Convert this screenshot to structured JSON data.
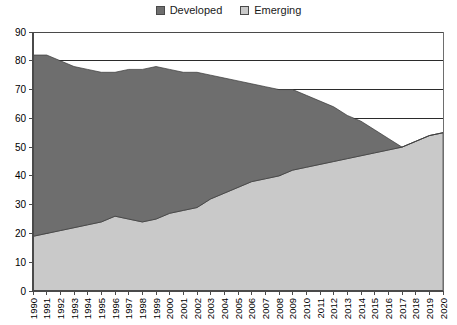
{
  "legend": {
    "position": "top-center",
    "entries": [
      {
        "label": "Developed",
        "color": "#6e6e6e",
        "swatch": "developed-swatch"
      },
      {
        "label": "Emerging",
        "color": "#c9c9c9",
        "swatch": "emerging-swatch"
      }
    ]
  },
  "chart_data": {
    "type": "area",
    "stacked": true,
    "title": "",
    "subtitle": "",
    "xlabel": "",
    "ylabel": "",
    "xlim": [
      1990,
      2020
    ],
    "ylim": [
      0,
      90
    ],
    "ytick_step": 10,
    "grid": true,
    "grid_axis": "y",
    "legend_position": "top-center",
    "categories": [
      "1990",
      "1991",
      "1992",
      "1993",
      "1994",
      "1995",
      "1996",
      "1997",
      "1998",
      "1999",
      "2000",
      "2001",
      "2002",
      "2003",
      "2004",
      "2005",
      "2006",
      "2007",
      "2008",
      "2009",
      "2010",
      "2011",
      "2012",
      "2013",
      "2014",
      "2015",
      "2016",
      "2017",
      "2018",
      "2019",
      "2020"
    ],
    "x": [
      1990,
      1991,
      1992,
      1993,
      1994,
      1995,
      1996,
      1997,
      1998,
      1999,
      2000,
      2001,
      2002,
      2003,
      2004,
      2005,
      2006,
      2007,
      2008,
      2009,
      2010,
      2011,
      2012,
      2013,
      2014,
      2015,
      2016,
      2017,
      2018,
      2019,
      2020
    ],
    "series": [
      {
        "name": "Emerging",
        "color": "#c9c9c9",
        "stack_order": 1,
        "values": [
          19,
          20,
          21,
          22,
          23,
          24,
          26,
          25,
          24,
          25,
          27,
          28,
          29,
          32,
          34,
          36,
          38,
          39,
          40,
          42,
          43,
          44,
          45,
          46,
          47,
          48,
          49,
          50,
          52,
          54,
          55
        ]
      },
      {
        "name": "Developed",
        "color": "#6e6e6e",
        "stack_order": 2,
        "values": [
          63,
          62,
          59,
          56,
          54,
          52,
          50,
          52,
          53,
          53,
          50,
          48,
          47,
          43,
          40,
          37,
          34,
          32,
          30,
          28,
          25,
          22,
          19,
          15,
          12,
          8,
          4,
          0,
          0,
          0,
          0
        ]
      }
    ],
    "stacked_totals": [
      82,
      82,
      80,
      78,
      77,
      76,
      76,
      77,
      77,
      78,
      77,
      76,
      76,
      75,
      74,
      73,
      72,
      71,
      70,
      70,
      68,
      66,
      64,
      61,
      59,
      56,
      53,
      50,
      52,
      54,
      55
    ]
  },
  "axes": {
    "y_ticks": [
      "0",
      "10",
      "20",
      "30",
      "40",
      "50",
      "60",
      "70",
      "80",
      "90"
    ],
    "x_ticks": [
      "1990",
      "1991",
      "1992",
      "1993",
      "1994",
      "1995",
      "1996",
      "1997",
      "1998",
      "1999",
      "2000",
      "2001",
      "2002",
      "2003",
      "2004",
      "2005",
      "2006",
      "2007",
      "2008",
      "2009",
      "2010",
      "2011",
      "2012",
      "2013",
      "2014",
      "2015",
      "2016",
      "2017",
      "2018",
      "2019",
      "2020"
    ]
  },
  "colors": {
    "developed": "#6e6e6e",
    "emerging": "#c9c9c9",
    "gridline": "#2b2b2b",
    "axis": "#4a4a4a",
    "text": "#000000",
    "background": "#ffffff"
  }
}
